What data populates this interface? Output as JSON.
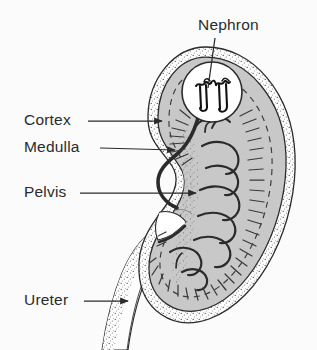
{
  "figure": {
    "background_color": "#fbfbfb",
    "ink_color": "#2b2b2b",
    "parenchyma_fill": "#c8c8c8",
    "capsule_fill": "#fdfdfd",
    "inset_fill": "#ffffff"
  },
  "labels": {
    "nephron": {
      "text": "Nephron",
      "x": 198,
      "y": 30,
      "anchor": "start"
    },
    "cortex": {
      "text": "Cortex",
      "x": 24,
      "y": 125,
      "anchor": "start"
    },
    "medulla": {
      "text": "Medulla",
      "x": 24,
      "y": 152,
      "anchor": "start"
    },
    "pelvis": {
      "text": "Pelvis",
      "x": 24,
      "y": 197,
      "anchor": "start"
    },
    "ureter": {
      "text": "Ureter",
      "x": 24,
      "y": 305,
      "anchor": "start"
    }
  },
  "leaders": {
    "nephron": {
      "from_x": 215,
      "from_y": 38,
      "to_x": 208,
      "to_y": 88,
      "arrow": false
    },
    "cortex": {
      "from_x": 88,
      "from_y": 121,
      "to_x": 162,
      "to_y": 121,
      "arrow": true
    },
    "medulla": {
      "from_x": 100,
      "from_y": 148,
      "to_x": 175,
      "to_y": 150,
      "arrow": true
    },
    "pelvis": {
      "from_x": 80,
      "from_y": 193,
      "to_x": 196,
      "to_y": 193,
      "arrow": true
    },
    "ureter": {
      "from_x": 84,
      "from_y": 301,
      "to_x": 128,
      "to_y": 301,
      "arrow": true
    }
  },
  "inset": {
    "name": "nephron-inset-circle",
    "center_x": 212,
    "center_y": 92,
    "radius": 30
  },
  "structures": {
    "capsule": "outer stippled renal capsule band",
    "cortex": "outer gray parenchyma zone",
    "medulla": "inner zone bounded by dashed line",
    "pyramids": "C-shaped renal pyramids and calyces",
    "pelvis": "stippled central renal pelvis",
    "ureter": "tube descending from hilum"
  }
}
